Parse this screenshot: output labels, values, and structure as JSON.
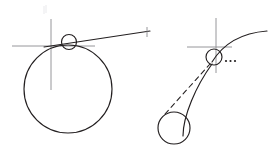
{
  "figure": {
    "background_color": "#ffffff",
    "ink_color": "#231f20",
    "axis_color": "#8a8a8e",
    "faint_color": "#e9e9ec",
    "width": 269,
    "height": 159,
    "panels": [
      {
        "id": "left-panel",
        "label": "Circle with tangent line at contact point",
        "elements": [
          {
            "name": "large-circle",
            "kind": "circle",
            "cx": 68,
            "cy": 89,
            "r": 44,
            "style": "solid"
          },
          {
            "name": "contact-circle",
            "kind": "circle",
            "cx": 69,
            "cy": 42,
            "r": 7.5,
            "style": "solid"
          },
          {
            "name": "vertical-axis",
            "kind": "line",
            "x1": 51,
            "y1": 19,
            "x2": 51,
            "y2": 90,
            "style": "thin"
          },
          {
            "name": "horizontal-axis",
            "kind": "line",
            "x1": 12,
            "y1": 46,
            "x2": 95,
            "y2": 46,
            "style": "thin"
          },
          {
            "name": "tangent-line",
            "kind": "line",
            "x1": 44,
            "y1": 47,
            "x2": 150,
            "y2": 31,
            "style": "solid"
          },
          {
            "name": "tangent-end-tick",
            "kind": "line",
            "x1": 147,
            "y1": 27,
            "x2": 147,
            "y2": 37,
            "style": "thin"
          }
        ]
      },
      {
        "id": "right-panel",
        "label": "Curve with dashed radius from offset circle",
        "elements": [
          {
            "name": "curve-path",
            "kind": "curve",
            "d": "M 183 135 C 185 112, 200 88, 214 62",
            "style": "solid"
          },
          {
            "name": "upper-curve-path",
            "kind": "curve",
            "d": "M 212 61 C 222 44, 240 33, 266 31",
            "style": "solid"
          },
          {
            "name": "contact-circle",
            "kind": "circle",
            "cx": 214,
            "cy": 57,
            "r": 8,
            "style": "solid"
          },
          {
            "name": "lower-circle",
            "kind": "circle",
            "cx": 174,
            "cy": 128,
            "r": 16,
            "style": "solid"
          },
          {
            "name": "radius-dashed-line",
            "kind": "line",
            "x1": 165,
            "y1": 114,
            "x2": 210,
            "y2": 64,
            "style": "dashed"
          },
          {
            "name": "vertical-axis",
            "kind": "line",
            "x1": 216,
            "y1": 18,
            "x2": 216,
            "y2": 73,
            "style": "thin"
          },
          {
            "name": "horizontal-axis",
            "kind": "line",
            "x1": 187,
            "y1": 47,
            "x2": 232,
            "y2": 47,
            "style": "thin"
          },
          {
            "name": "ellipsis-marker",
            "kind": "dots",
            "count": 3,
            "x": 226,
            "y": 61,
            "spacing": 4.5,
            "radius": 1.1
          }
        ]
      }
    ],
    "faint_marks": [
      {
        "name": "top-faint-smudge",
        "x1": 44,
        "y1": 6,
        "x2": 44,
        "y2": 14
      }
    ]
  }
}
